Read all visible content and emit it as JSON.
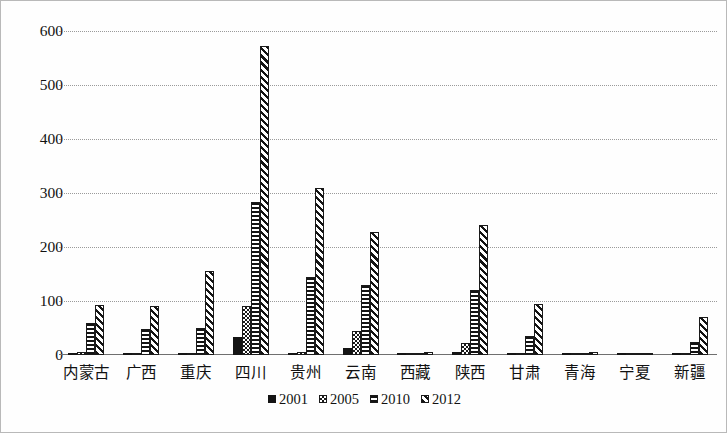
{
  "chart_data": {
    "type": "bar",
    "title": "",
    "subtitle": "",
    "xlabel": "",
    "ylabel": "",
    "ylim": [
      0,
      600
    ],
    "ytick_values": [
      0,
      100,
      200,
      300,
      400,
      500,
      600
    ],
    "ytick_labels": [
      "0",
      "100",
      "200",
      "300",
      "400",
      "500",
      "600"
    ],
    "grid": true,
    "grid_style": "dotted-horizontal",
    "legend_position": "bottom-center",
    "categories": [
      "内蒙古",
      "广西",
      "重庆",
      "四川",
      "贵州",
      "云南",
      "西藏",
      "陕西",
      "甘肃",
      "青海",
      "宁夏",
      "新疆"
    ],
    "series": [
      {
        "name": "2001",
        "pattern": "solid-black",
        "values": [
          1,
          1,
          2,
          33,
          1,
          13,
          0,
          5,
          1,
          0,
          0,
          1
        ]
      },
      {
        "name": "2005",
        "pattern": "cross-hatch",
        "values": [
          5,
          4,
          3,
          90,
          5,
          45,
          1,
          22,
          4,
          2,
          2,
          3
        ]
      },
      {
        "name": "2010",
        "pattern": "horizontal-stripes",
        "values": [
          60,
          48,
          50,
          283,
          145,
          130,
          3,
          120,
          35,
          3,
          2,
          25
        ]
      },
      {
        "name": "2012",
        "pattern": "diagonal-stripes",
        "values": [
          93,
          90,
          155,
          573,
          310,
          227,
          5,
          240,
          95,
          5,
          4,
          70
        ]
      }
    ],
    "annotations": []
  },
  "legend": {
    "items": [
      {
        "label": "2001",
        "pattern": "solid-black"
      },
      {
        "label": "2005",
        "pattern": "cross-hatch"
      },
      {
        "label": "2010",
        "pattern": "horizontal-stripes"
      },
      {
        "label": "2012",
        "pattern": "diagonal-stripes"
      }
    ]
  },
  "colors": {
    "ink": "#141414",
    "gridline": "#9a9a9a",
    "axis": "#6f6f6f",
    "border": "#b9b9b9",
    "background": "#ffffff"
  }
}
